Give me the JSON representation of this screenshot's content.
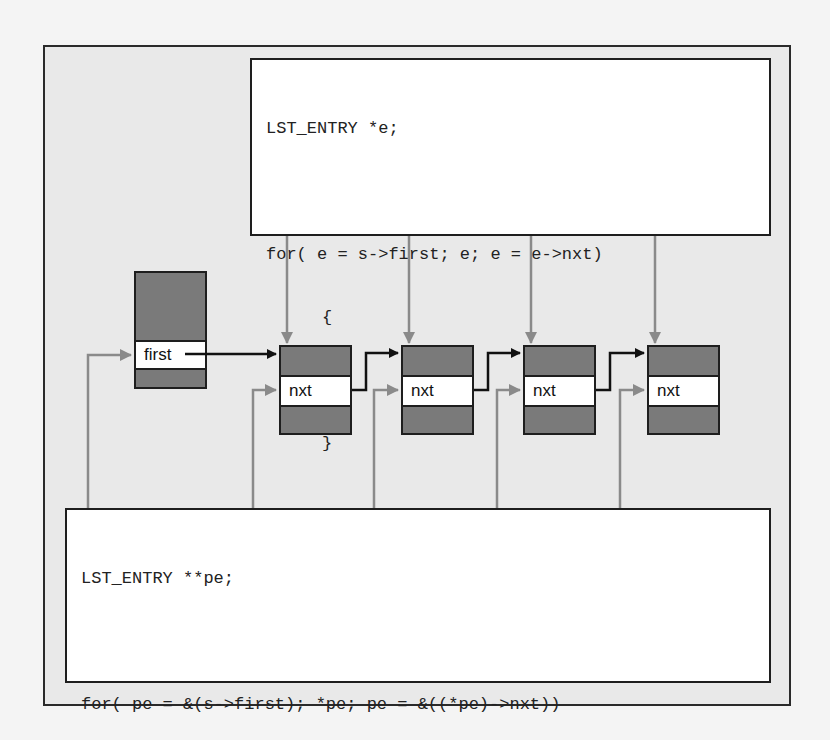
{
  "diagram": {
    "colors": {
      "frame_bg": "#e9e9e9",
      "node_fill": "#7a7a7a",
      "node_border": "#1e1e1e",
      "band_fill": "#ffffff",
      "pointer_arrow": "#111111",
      "reference_arrow": "#8a8a8a"
    },
    "top_code": {
      "lines": [
        "LST_ENTRY *e;",
        "",
        "for( e = s->first; e; e = e->nxt)",
        "{",
        "...",
        "}"
      ]
    },
    "bottom_code": {
      "lines": [
        "LST_ENTRY **pe;",
        "",
        "for( pe = &(s->first); *pe; pe = &((*pe)->nxt))",
        "{",
        "...",
        "}"
      ]
    },
    "head_node": {
      "field_label": "first"
    },
    "list_nodes": [
      {
        "field_label": "nxt"
      },
      {
        "field_label": "nxt"
      },
      {
        "field_label": "nxt"
      },
      {
        "field_label": "nxt"
      }
    ],
    "arrows": {
      "black_pointer_links": [
        "first -> node 1",
        "node 1 nxt -> node 2",
        "node 2 nxt -> node 3",
        "node 3 nxt -> node 4"
      ],
      "gray_from_top_code_to_nodes": [
        "node 1",
        "node 2",
        "node 3",
        "node 4"
      ],
      "gray_from_bottom_code_to_fields": [
        "first",
        "node 1 nxt",
        "node 2 nxt",
        "node 3 nxt",
        "node 4 nxt"
      ]
    }
  }
}
